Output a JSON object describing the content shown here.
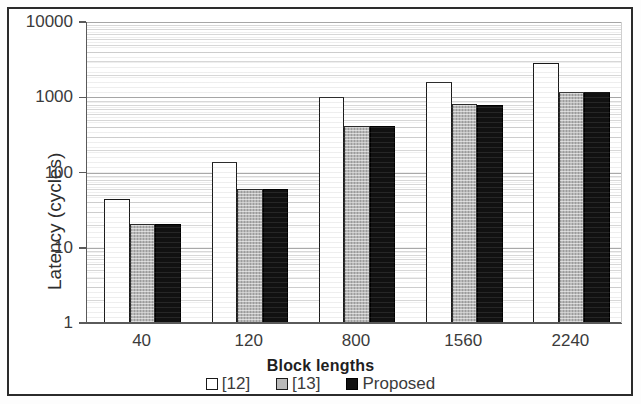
{
  "chart_data": {
    "type": "bar",
    "title": "",
    "xlabel": "Block lengths",
    "ylabel": "Latency (cycles)",
    "yscale": "log",
    "ylim": [
      1,
      10000
    ],
    "ytick_labels": [
      "10000",
      "1000",
      "100",
      "10",
      "1"
    ],
    "ytick_values": [
      10000,
      1000,
      100,
      10,
      1
    ],
    "grid": true,
    "legend_position": "bottom",
    "categories": [
      "40",
      "120",
      "800",
      "1560",
      "2240"
    ],
    "series": [
      {
        "name": "[12]",
        "values": [
          45,
          140,
          1020,
          1620,
          2850
        ]
      },
      {
        "name": "[13]",
        "values": [
          21,
          61,
          420,
          810,
          1160
        ]
      },
      {
        "name": "Proposed",
        "values": [
          21,
          61,
          410,
          800,
          1160
        ]
      }
    ],
    "colors": {
      "series_0": "#ffffff",
      "series_1": "#b9b9b9",
      "series_2": "#111111",
      "axis": "#5a5a5a",
      "grid": "#9a9a9a",
      "text": "#3b3b3b",
      "frame": "#2b2b2b"
    },
    "legend_swatches": [
      "white-square",
      "gray-square",
      "black-square"
    ]
  }
}
